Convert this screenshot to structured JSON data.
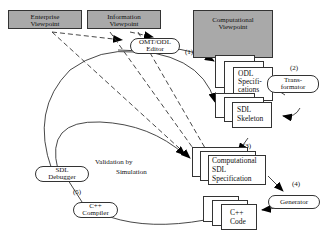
{
  "viewpoints": {
    "enterprise": [
      "Enterprise",
      "Viewpoint"
    ],
    "information": [
      "Information",
      "Viewpoint"
    ],
    "computational": [
      "Computational",
      "Viewpoint"
    ]
  },
  "tools": {
    "editor": [
      "OMT/ODL",
      "Editor"
    ],
    "transformator": [
      "Trans-",
      "formator"
    ],
    "generator": [
      "Generator"
    ],
    "debugger": [
      "SDL",
      "Debugger"
    ],
    "compiler": [
      "C++",
      "Compiler"
    ]
  },
  "documents": {
    "odl_spec": [
      "ODL",
      "Specifi-",
      "cations"
    ],
    "sdl_skeleton": [
      "SDL",
      "Skeleton"
    ],
    "comp_sdl_spec": [
      "Computational",
      "SDL",
      "Specification"
    ],
    "cpp_code": [
      "C++",
      "Code"
    ]
  },
  "steps": [
    "(1)",
    "(2)",
    "(3)",
    "(4)",
    "(5)"
  ],
  "annotation": [
    "Validation by",
    "Simulation"
  ]
}
